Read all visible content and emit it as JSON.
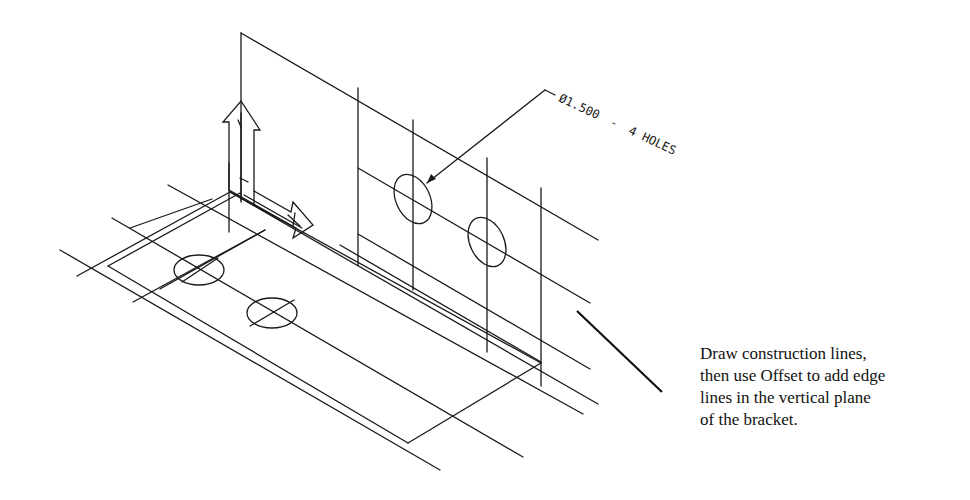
{
  "figure": {
    "dimension_label": {
      "diameter": "Ø1.500",
      "separator": "-",
      "count": "4 HOLES"
    },
    "caption": {
      "lines": [
        "Draw construction lines,",
        "then use Offset to add edge",
        "lines in the vertical plane",
        "of the bracket."
      ]
    },
    "colors": {
      "line": "#1a1a1a",
      "background": "#ffffff"
    }
  }
}
